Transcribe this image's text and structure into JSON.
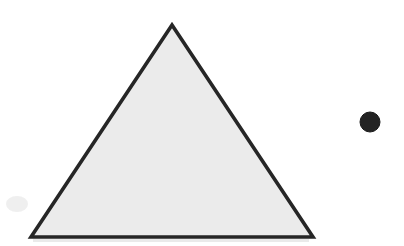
{
  "canvas": {
    "width": 404,
    "height": 246,
    "background_color": "#ffffff",
    "title": "Geometric Shapes",
    "description": "A large light-gray outlined triangle on the left and a small solid dark circle on the right, on a white background."
  },
  "shapes": [
    {
      "name": "triangle",
      "type": "polygon",
      "sides": 3,
      "label": "Triangle",
      "points": "172,25 313,237 31,237",
      "vertices": {
        "apex": {
          "x": 172,
          "y": 25
        },
        "bottom_right": {
          "x": 313,
          "y": 237
        },
        "bottom_left": {
          "x": 31,
          "y": 237
        }
      },
      "fill_color": "#ebebeb",
      "stroke_color": "#262626",
      "stroke_width": 3.6,
      "approx_width": 282,
      "approx_height": 212
    },
    {
      "name": "circle",
      "type": "circle",
      "label": "Circle",
      "center": {
        "x": 370,
        "y": 122
      },
      "radius": 10,
      "fill_color": "#232323",
      "stroke_color": "#1a1a1a",
      "stroke_width": 1
    }
  ],
  "artifacts": [
    {
      "name": "base-shadow-band",
      "description": "Faint light-gray horizontal band just beneath the triangle base",
      "color": "#d8d8d8",
      "x": 33,
      "y": 239,
      "width": 276,
      "height": 3,
      "opacity": 0.55
    },
    {
      "name": "scan-smudge-lower-left",
      "description": "Very faint gray smudge in the lower-left empty area",
      "color": "#e9e9e9",
      "x": 6,
      "y": 196,
      "width": 22,
      "height": 16,
      "opacity": 0.75
    }
  ]
}
